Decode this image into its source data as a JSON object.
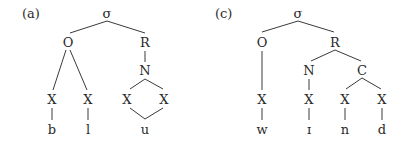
{
  "trees": [
    {
      "label": "(a)",
      "root": "σ",
      "onset": "O",
      "rime": "R",
      "nucleus": "N",
      "x_slots": [
        "X",
        "X",
        "X",
        "X"
      ],
      "segments": [
        "b",
        "l",
        "u"
      ]
    },
    {
      "label": "(c)",
      "root": "σ",
      "onset": "O",
      "rime": "R",
      "nucleus": "N",
      "coda": "C",
      "x_slots": [
        "X",
        "X",
        "X",
        "X"
      ],
      "segments": [
        "w",
        "ɪ",
        "n",
        "d"
      ]
    }
  ]
}
